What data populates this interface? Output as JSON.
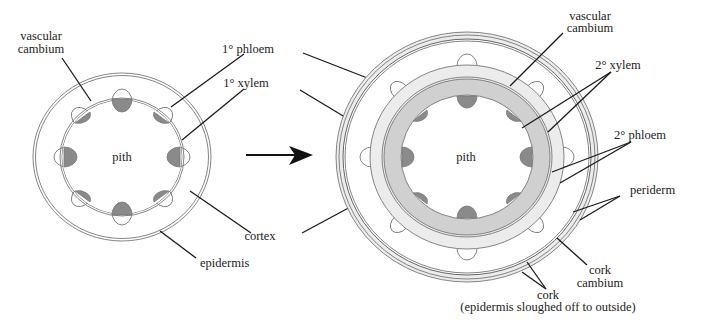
{
  "figure": {
    "colors": {
      "background": "#ffffff",
      "outline": "#777777",
      "primary_xylem": "#8a8a8a",
      "secondary_xylem": "#d0d0d0",
      "secondary_phloem": "#ececec",
      "periderm": "#ececec",
      "leader_line": "#1a1a1a"
    },
    "primary_stem": {
      "labels": {
        "vascular_cambium_line1": "vascular",
        "vascular_cambium_line2": "cambium",
        "pith": "pith",
        "epidermis": "epidermis"
      },
      "bundle_count": 8
    },
    "shared_labels": {
      "primary_phloem": "1° phloem",
      "primary_xylem": "1° xylem",
      "cortex": "cortex"
    },
    "secondary_stem": {
      "labels": {
        "vascular_cambium_line1": "vascular",
        "vascular_cambium_line2": "cambium",
        "secondary_xylem": "2° xylem",
        "secondary_phloem": "2° phloem",
        "periderm": "periderm",
        "cork_cambium_line1": "cork",
        "cork_cambium_line2": "cambium",
        "pith": "pith",
        "cork_line1": "cork",
        "cork_line2": "(epidermis sloughed off to outside)"
      },
      "bundle_count": 8
    },
    "arrow": {
      "direction": "right",
      "meaning": "growth transition"
    }
  }
}
